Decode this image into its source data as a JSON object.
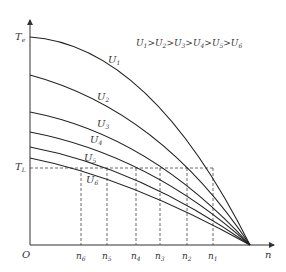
{
  "diagram": {
    "title_relation": "U1>U2>U3>U4>U5>U6",
    "relation_parts": [
      {
        "base": "U",
        "sub": "1"
      },
      {
        "op": ">"
      },
      {
        "base": "U",
        "sub": "2"
      },
      {
        "op": ">"
      },
      {
        "base": "U",
        "sub": "3"
      },
      {
        "op": ">"
      },
      {
        "base": "U",
        "sub": "4"
      },
      {
        "op": ">"
      },
      {
        "base": "U",
        "sub": "5"
      },
      {
        "op": ">"
      },
      {
        "base": "U",
        "sub": "6"
      }
    ],
    "axes": {
      "y_label": {
        "base": "T",
        "sub": "e"
      },
      "x_label": "n",
      "origin_label": "O",
      "load_torque_label": {
        "base": "T",
        "sub": "L"
      }
    },
    "curves": [
      {
        "id": "U1",
        "base": "U",
        "sub": "1"
      },
      {
        "id": "U2",
        "base": "U",
        "sub": "2"
      },
      {
        "id": "U3",
        "base": "U",
        "sub": "3"
      },
      {
        "id": "U4",
        "base": "U",
        "sub": "4"
      },
      {
        "id": "U5",
        "base": "U",
        "sub": "5"
      },
      {
        "id": "U6",
        "base": "U",
        "sub": "6"
      }
    ],
    "speed_ticks": [
      {
        "base": "n",
        "sub": "6"
      },
      {
        "base": "n",
        "sub": "5"
      },
      {
        "base": "n",
        "sub": "4"
      },
      {
        "base": "n",
        "sub": "3"
      },
      {
        "base": "n",
        "sub": "2"
      },
      {
        "base": "n",
        "sub": "1"
      }
    ],
    "colors": {
      "curve": "#222222",
      "axis": "#333333",
      "dashed": "#444444",
      "text": "#333333"
    }
  }
}
